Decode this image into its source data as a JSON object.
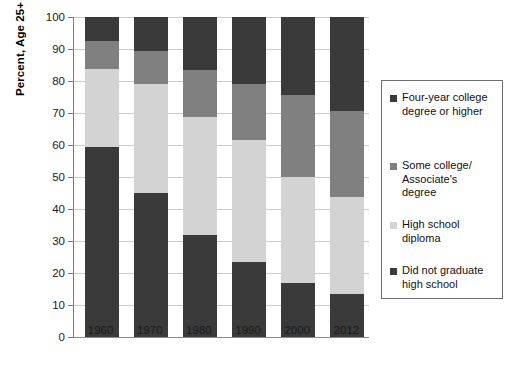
{
  "chart_data": {
    "type": "bar",
    "subtype": "stacked-bar-vertical",
    "title": "",
    "xlabel": "",
    "ylabel": "Percent, Age 25+",
    "ylim": [
      0,
      100
    ],
    "yticks": [
      0,
      10,
      20,
      30,
      40,
      50,
      60,
      70,
      80,
      90,
      100
    ],
    "ytick_labels": [
      "0",
      "10",
      "20",
      "30",
      "40",
      "50",
      "60",
      "70",
      "80",
      "90",
      "100"
    ],
    "grid": true,
    "grid_axis": "y",
    "legend_position": "right",
    "categories": [
      "1960",
      "1970",
      "1980",
      "1990",
      "2000",
      "2012"
    ],
    "stack_order_bottom_to_top": [
      "Did not graduate high school",
      "High school diploma",
      "Some college/ Associate's degree",
      "Four-year college degree or higher"
    ],
    "series": [
      {
        "name": "Did not graduate high school",
        "color": "#3a3a3a",
        "values": [
          59.4,
          45.1,
          31.9,
          23.3,
          16.9,
          13.5
        ]
      },
      {
        "name": "High school diploma",
        "color": "#d3d3d3",
        "values": [
          24.3,
          33.9,
          36.8,
          38.2,
          33.1,
          30.4
        ]
      },
      {
        "name": "Some college/ Associate's degree",
        "color": "#808080",
        "values": [
          8.8,
          10.5,
          14.8,
          17.5,
          25.6,
          26.6
        ]
      },
      {
        "name": "Four-year college degree or higher",
        "color": "#3a3a3a",
        "values": [
          7.5,
          10.5,
          16.5,
          21.0,
          24.4,
          29.5
        ]
      }
    ],
    "cumulative_tops": {
      "1960": [
        59.4,
        83.7,
        92.5,
        100
      ],
      "1970": [
        45.1,
        79.0,
        89.5,
        100
      ],
      "1980": [
        31.9,
        68.7,
        83.5,
        100
      ],
      "1990": [
        23.3,
        61.5,
        79.0,
        100
      ],
      "2000": [
        16.9,
        50.0,
        75.6,
        100
      ],
      "2012": [
        13.5,
        43.9,
        70.5,
        100
      ]
    }
  },
  "legend": {
    "entries": [
      {
        "label": "Four-year college degree or higher",
        "line1": "Four-year college",
        "line2": "degree or higher",
        "color": "#3a3a3a"
      },
      {
        "label": "Some college/ Associate's degree",
        "line1": "Some college/",
        "line2": "Associate's",
        "line3": "degree",
        "color": "#808080"
      },
      {
        "label": "High school diploma",
        "line1": "High school",
        "line2": "diploma",
        "color": "#d3d3d3"
      },
      {
        "label": "Did not graduate high school",
        "line1": "Did not graduate",
        "line2": "high school",
        "color": "#3a3a3a"
      }
    ]
  },
  "colors": {
    "dark": "#3a3a3a",
    "medium": "#808080",
    "light": "#d3d3d3",
    "gridline": "#c9c9c9",
    "axis": "#7b7b7b",
    "background": "#ffffff"
  }
}
